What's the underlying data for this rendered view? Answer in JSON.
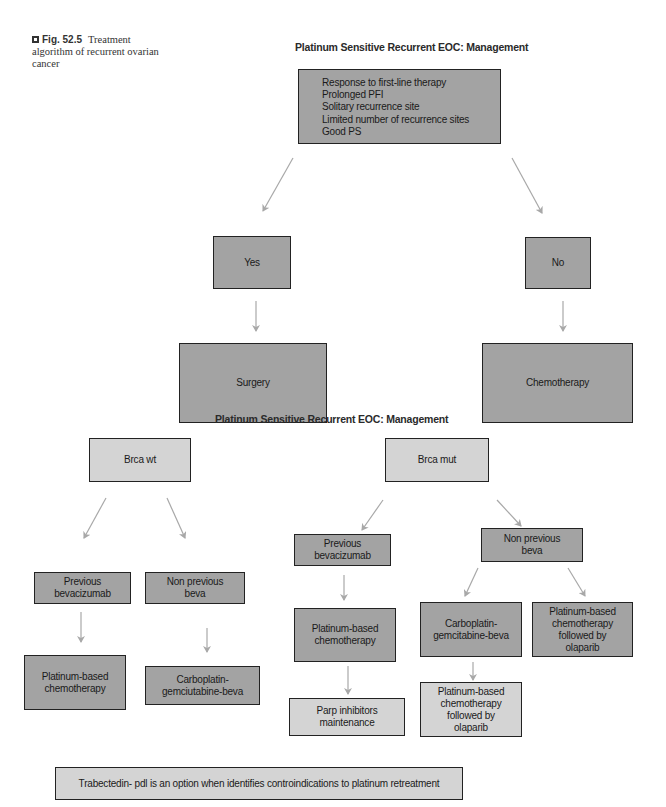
{
  "caption": {
    "figure_label": "Fig. 52.5",
    "text": "Treatment algorithm of recurrent ovarian cancer"
  },
  "diagram1": {
    "title": "Platinum Sensitive Recurrent EOC: Management",
    "criteria": [
      "Response to first-line therapy",
      "Prolonged PFI",
      "Solitary recurrence site",
      "Limited number of recurrence sites",
      "Good PS"
    ],
    "yes_label": "Yes",
    "no_label": "No",
    "yes_outcome": "Surgery",
    "no_outcome": "Chemotherapy"
  },
  "diagram2": {
    "title": "Platinum Sensitive Recurrent EOC: Management",
    "brca_wt": {
      "label": "Brca wt",
      "previous_beva": "Previous bevacizumab",
      "non_previous_beva": "Non previous beva",
      "previous_beva_treatment": "Platinum-based chemotherapy",
      "non_previous_beva_treatment": "Carboplatin-gemciutabine-beva"
    },
    "brca_mut": {
      "label": "Brca mut",
      "previous_beva": "Previous bevacizumab",
      "non_previous_beva": "Non previous beva",
      "previous_beva_treatment": "Platinum-based chemotherapy",
      "previous_beva_maintenance": "Parp inhibitors maintenance",
      "non_previous_beva_option1": "Carboplatin-gemcitabine-beva",
      "non_previous_beva_option1_followup": "Platinum-based chemotherapy followed by olaparib",
      "non_previous_beva_option2": "Platinum-based chemotherapy followed by olaparib"
    },
    "footnote": "Trabectedin- pdl is an option when identifies controindications to platinum retreatment"
  },
  "colors": {
    "dark_box": "#a3a3a3",
    "light_box": "#d4d4d4",
    "arrow": "#a8a8a8",
    "border": "#222222"
  }
}
